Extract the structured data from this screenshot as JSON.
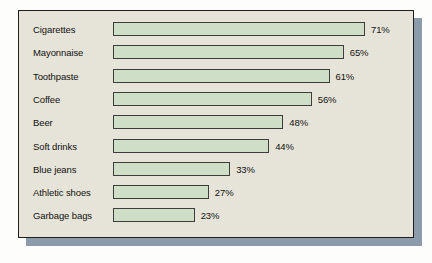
{
  "chart_data": {
    "type": "bar",
    "orientation": "horizontal",
    "title": "",
    "subtitle": "",
    "xlabel": "",
    "ylabel": "",
    "grid": false,
    "legend": null,
    "axis_visible": false,
    "xlim": [
      0,
      71
    ],
    "value_suffix": "%",
    "categories": [
      "Cigarettes",
      "Mayonnaise",
      "Toothpaste",
      "Coffee",
      "Beer",
      "Soft drinks",
      "Blue jeans",
      "Athletic shoes",
      "Garbage bags"
    ],
    "values": [
      71,
      65,
      61,
      56,
      48,
      44,
      33,
      27,
      23
    ],
    "data_labels": [
      "71%",
      "65%",
      "61%",
      "56%",
      "48%",
      "44%",
      "33%",
      "27%",
      "23%"
    ],
    "bars": [
      {
        "label": "Cigarettes",
        "value": 71,
        "display": "71%"
      },
      {
        "label": "Mayonnaise",
        "value": 65,
        "display": "65%"
      },
      {
        "label": "Toothpaste",
        "value": 61,
        "display": "61%"
      },
      {
        "label": "Coffee",
        "value": 56,
        "display": "56%"
      },
      {
        "label": "Beer",
        "value": 48,
        "display": "48%"
      },
      {
        "label": "Soft drinks",
        "value": 44,
        "display": "44%"
      },
      {
        "label": "Blue jeans",
        "value": 33,
        "display": "33%"
      },
      {
        "label": "Athletic shoes",
        "value": 27,
        "display": "27%"
      },
      {
        "label": "Garbage bags",
        "value": 23,
        "display": "23%"
      }
    ],
    "colors": {
      "bar_fill": "#cfdec6",
      "bar_border": "#3d3d3d",
      "panel_background": "#e6e4d8",
      "panel_border": "#1e1e1e",
      "shadow": "#8c9bab",
      "page_background": "#fdfdfb",
      "text": "#111111"
    }
  }
}
